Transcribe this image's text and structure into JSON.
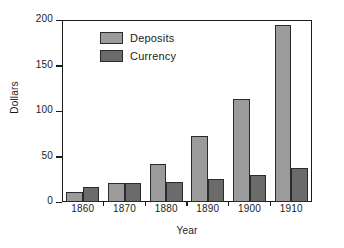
{
  "chart_data": {
    "type": "bar",
    "title": "",
    "subtitle": "",
    "xlabel": "Year",
    "ylabel": "Dollars",
    "categories": [
      "1860",
      "1870",
      "1880",
      "1890",
      "1900",
      "1910"
    ],
    "series": [
      {
        "name": "Deposits",
        "color": "#9b9b9b",
        "values": [
          11,
          21,
          42,
          72,
          113,
          194
        ]
      },
      {
        "name": "Currency",
        "color": "#6b6b6b",
        "values": [
          16,
          21,
          22,
          25,
          30,
          37
        ]
      }
    ],
    "ylim": [
      0,
      200
    ],
    "yticks": [
      0,
      50,
      100,
      150,
      200
    ],
    "ytick_labels": [
      "0",
      "50",
      "100",
      "150",
      "200"
    ],
    "grid": false,
    "legend_position": "upper-left-inside",
    "axis_color": "#1b1b1b",
    "bar_edge_color": "#2b2b2b",
    "background": "#ffffff"
  }
}
